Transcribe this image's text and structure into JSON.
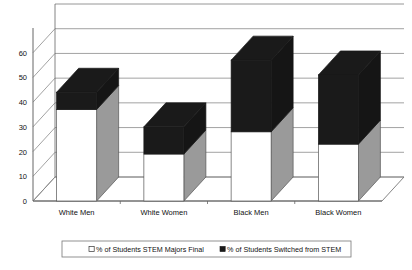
{
  "chart_data": {
    "type": "bar",
    "subtype": "stacked-column-3d",
    "title": "",
    "xlabel": "",
    "ylabel": "",
    "ylim": [
      0,
      70
    ],
    "yticks": [
      0,
      10,
      20,
      30,
      40,
      50,
      60
    ],
    "ytick_labels": [
      "0",
      "10",
      "20",
      "30",
      "40",
      "50",
      "60"
    ],
    "grid": true,
    "grid_orientation": "horizontal",
    "legend_position": "bottom",
    "categories": [
      "White Men",
      "White Women",
      "Black Men",
      "Black Women"
    ],
    "series": [
      {
        "name": "% of Students STEM Majors Final",
        "marker": "open-square",
        "color": "#ffffff",
        "values": [
          37,
          19,
          28,
          23
        ]
      },
      {
        "name": "% of Students Switched from STEM",
        "marker": "filled-square",
        "color": "#1a1a1a",
        "values": [
          7,
          11,
          29,
          28
        ]
      }
    ],
    "totals": [
      44,
      30,
      57,
      51
    ]
  },
  "legend": {
    "entries": [
      {
        "label": "% of Students STEM Majors Final",
        "swatch": "open-square"
      },
      {
        "label": "% of Students Switched from STEM",
        "swatch": "filled-square"
      }
    ]
  },
  "colors": {
    "bar_front_bottom": "#ffffff",
    "bar_front_top": "#1a1a1a",
    "bar_side": "#9a9a9a",
    "bar_side_dark": "#151515",
    "bar_outline": "#555555",
    "axis": "#666666",
    "grid": "#8a8a8a",
    "floor": "#ffffff",
    "background": "#ffffff"
  }
}
